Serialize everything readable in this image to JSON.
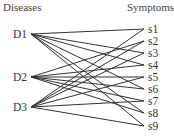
{
  "diagram": {
    "left_header": "Diseases",
    "right_header": "Symptoms",
    "diseases": [
      {
        "label": "D1",
        "y": 34
      },
      {
        "label": "D2",
        "y": 77
      },
      {
        "label": "D3",
        "y": 107
      }
    ],
    "symptoms": [
      {
        "label": "s1",
        "y": 29
      },
      {
        "label": "s2",
        "y": 41
      },
      {
        "label": "s3",
        "y": 53
      },
      {
        "label": "s4",
        "y": 65
      },
      {
        "label": "s5",
        "y": 77
      },
      {
        "label": "s6",
        "y": 89
      },
      {
        "label": "s7",
        "y": 101
      },
      {
        "label": "s8",
        "y": 113
      },
      {
        "label": "s9",
        "y": 126
      }
    ],
    "edges": [
      [
        "D1",
        "s1"
      ],
      [
        "D1",
        "s3"
      ],
      [
        "D1",
        "s4"
      ],
      [
        "D1",
        "s6"
      ],
      [
        "D1",
        "s8"
      ],
      [
        "D1",
        "s9"
      ],
      [
        "D2",
        "s2"
      ],
      [
        "D2",
        "s4"
      ],
      [
        "D2",
        "s5"
      ],
      [
        "D2",
        "s6"
      ],
      [
        "D2",
        "s7"
      ],
      [
        "D2",
        "s8"
      ],
      [
        "D3",
        "s1"
      ],
      [
        "D3",
        "s2"
      ],
      [
        "D3",
        "s3"
      ],
      [
        "D3",
        "s5"
      ],
      [
        "D3",
        "s7"
      ],
      [
        "D3",
        "s9"
      ]
    ],
    "line_color": "#333333"
  }
}
